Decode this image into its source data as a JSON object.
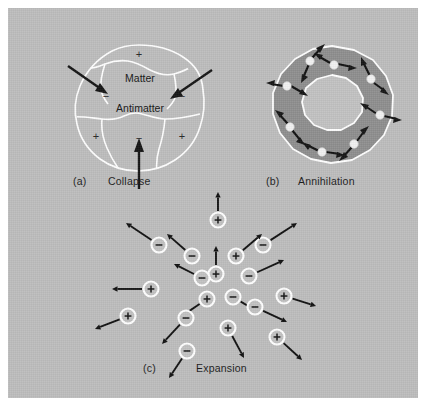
{
  "figure": {
    "background_color": "#bdbdbd",
    "border_color": "#ffffff",
    "ink_color": "#141414",
    "outline_color": "#ffffff",
    "ring_color": "#8e8e8e",
    "ring_hole_color": "#c2c2c2"
  },
  "panels": {
    "a": {
      "label": "(a)",
      "caption": "Collapse",
      "region_labels": [
        {
          "text": "Matter",
          "x": 80,
          "y": 52
        },
        {
          "text": "Antimatter",
          "x": 80,
          "y": 82
        }
      ],
      "charge_signs": [
        {
          "sign": "+",
          "x": 79,
          "y": 32
        },
        {
          "sign": "−",
          "x": 46,
          "y": 70
        },
        {
          "sign": "−",
          "x": 120,
          "y": 70
        },
        {
          "sign": "+",
          "x": 36,
          "y": 110
        },
        {
          "sign": "−",
          "x": 79,
          "y": 112
        },
        {
          "sign": "+",
          "x": 122,
          "y": 110
        }
      ],
      "inward_arrows": [
        {
          "x1": 12,
          "y1": 44,
          "x2": 47,
          "y2": 68
        },
        {
          "x1": 148,
          "y1": 48,
          "x2": 110,
          "y2": 72
        },
        {
          "x1": 79,
          "y1": 160,
          "x2": 79,
          "y2": 116
        }
      ]
    },
    "b": {
      "label": "(b)",
      "caption": "Annihilation",
      "node_count": 8,
      "outer_radius": 62,
      "inner_radius": 30,
      "node_radius": 46
    },
    "c": {
      "label": "(c)",
      "caption": "Expansion",
      "particles": [
        {
          "sign": "+",
          "x": 130,
          "y": 22,
          "ax": 130,
          "ay": -6
        },
        {
          "sign": "−",
          "x": 71,
          "y": 47,
          "ax": 38,
          "ay": 25
        },
        {
          "sign": "−",
          "x": 175,
          "y": 47,
          "ax": 209,
          "ay": 25
        },
        {
          "sign": "−",
          "x": 104,
          "y": 58,
          "ax": 79,
          "ay": 36
        },
        {
          "sign": "+",
          "x": 148,
          "y": 58,
          "ax": 174,
          "ay": 36
        },
        {
          "sign": "+",
          "x": 128,
          "y": 76,
          "ax": 128,
          "ay": 48
        },
        {
          "sign": "−",
          "x": 161,
          "y": 78,
          "ax": 196,
          "ay": 62
        },
        {
          "sign": "−",
          "x": 114,
          "y": 80,
          "ax": 86,
          "ay": 66
        },
        {
          "sign": "+",
          "x": 63,
          "y": 91,
          "ax": 24,
          "ay": 91
        },
        {
          "sign": "+",
          "x": 196,
          "y": 98,
          "ax": 228,
          "ay": 108
        },
        {
          "sign": "+",
          "x": 119,
          "y": 101,
          "ax": 94,
          "ay": 118
        },
        {
          "sign": "−",
          "x": 145,
          "y": 99,
          "ax": 172,
          "ay": 115
        },
        {
          "sign": "−",
          "x": 167,
          "y": 109,
          "ax": 199,
          "ay": 124
        },
        {
          "sign": "+",
          "x": 40,
          "y": 118,
          "ax": 7,
          "ay": 131
        },
        {
          "sign": "−",
          "x": 98,
          "y": 120,
          "ax": 74,
          "ay": 146
        },
        {
          "sign": "+",
          "x": 140,
          "y": 130,
          "ax": 156,
          "ay": 160
        },
        {
          "sign": "+",
          "x": 189,
          "y": 139,
          "ax": 214,
          "ay": 162
        },
        {
          "sign": "−",
          "x": 99,
          "y": 153,
          "ax": 81,
          "ay": 180
        }
      ]
    }
  }
}
